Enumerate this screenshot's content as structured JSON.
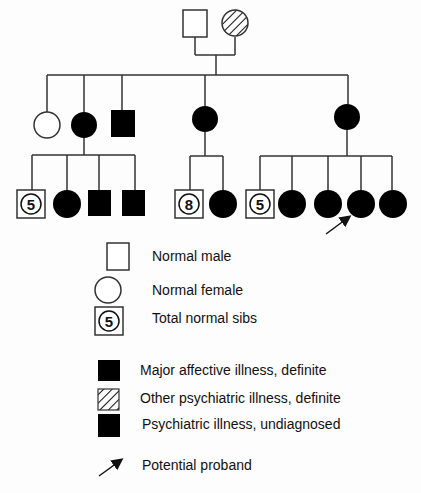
{
  "pedigree": {
    "generation_1": [
      {
        "sex": "male",
        "status": "normal"
      },
      {
        "sex": "female",
        "status": "other-psychiatric-illness"
      }
    ],
    "generation_2": [
      {
        "sex": "female",
        "status": "normal"
      },
      {
        "sex": "female",
        "status": "major-affective-illness",
        "children": [
          "normal-sibs-5",
          "female-affected",
          "male-affected",
          "male-affected"
        ]
      },
      {
        "sex": "male",
        "status": "major-affective-illness"
      },
      {
        "sex": "female",
        "status": "major-affective-illness",
        "children": [
          "normal-sibs-8",
          "female-affected"
        ]
      },
      {
        "sex": "female",
        "status": "major-affective-illness",
        "children": [
          "normal-sibs-5",
          "female-affected",
          "female-affected",
          "female-affected-proband",
          "female-affected"
        ]
      }
    ],
    "sib_counts": [
      "5",
      "8",
      "5"
    ]
  },
  "legend": {
    "items": [
      {
        "symbol": "open-square",
        "label": "Normal male"
      },
      {
        "symbol": "open-circle",
        "label": "Normal female"
      },
      {
        "symbol": "sibs-box",
        "count": "5",
        "label": "Total normal sibs"
      },
      {
        "symbol": "filled-square",
        "label": "Major affective illness, definite"
      },
      {
        "symbol": "hatched-square",
        "label": "Other psychiatric illness, definite"
      },
      {
        "symbol": "filled-square",
        "label": "Psychiatric illness, undiagnosed"
      },
      {
        "symbol": "arrow",
        "label": "Potential proband"
      }
    ]
  },
  "colors": {
    "line": "#333333",
    "fill": "#000000",
    "background": "#fdfdfd"
  }
}
